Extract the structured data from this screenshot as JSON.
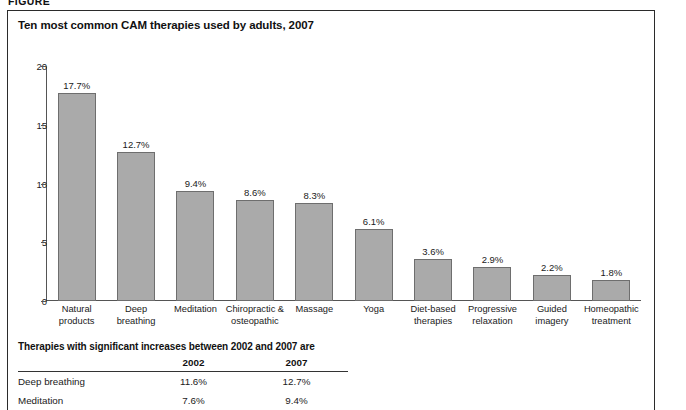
{
  "figure_stub": "FIGURE",
  "chart_title": "Ten most common CAM therapies used by adults, 2007",
  "chart_data": {
    "type": "bar",
    "title": "Ten most common CAM therapies used by adults, 2007",
    "xlabel": "",
    "ylabel": "",
    "ylim": [
      0,
      20
    ],
    "yticks": [
      0,
      5,
      10,
      15,
      20
    ],
    "ytick_labels": [
      "0",
      "5",
      "10",
      "15",
      "20"
    ],
    "grid": false,
    "legend": "none",
    "categories": [
      "Natural products",
      "Deep breathing",
      "Meditation",
      "Chiropractic & osteopathic",
      "Massage",
      "Yoga",
      "Diet-based therapies",
      "Progressive relaxation",
      "Guided imagery",
      "Homeopathic treatment"
    ],
    "category_lines": [
      [
        "Natural",
        "products"
      ],
      [
        "Deep",
        "breathing"
      ],
      [
        "Meditation"
      ],
      [
        "Chiropractic &",
        "osteopathic"
      ],
      [
        "Massage"
      ],
      [
        "Yoga"
      ],
      [
        "Diet-based",
        "therapies"
      ],
      [
        "Progressive",
        "relaxation"
      ],
      [
        "Guided",
        "imagery"
      ],
      [
        "Homeopathic",
        "treatment"
      ]
    ],
    "values": [
      17.7,
      12.7,
      9.4,
      8.6,
      8.3,
      6.1,
      3.6,
      2.9,
      2.2,
      1.8
    ],
    "value_labels": [
      "17.7%",
      "12.7%",
      "9.4%",
      "8.6%",
      "8.3%",
      "6.1%",
      "3.6%",
      "2.9%",
      "2.2%",
      "1.8%"
    ],
    "bar_color": "#aaaaaa",
    "bar_edge_color": "#6e6e6e"
  },
  "increase_table": {
    "heading": "Therapies with significant increases between 2002 and 2007 are",
    "columns": [
      "",
      "2002",
      "2007"
    ],
    "rows": [
      {
        "therapy": "Deep breathing",
        "y2002": "11.6%",
        "y2007": "12.7%"
      },
      {
        "therapy": "Meditation",
        "y2002": "7.6%",
        "y2007": "9.4%"
      }
    ]
  }
}
